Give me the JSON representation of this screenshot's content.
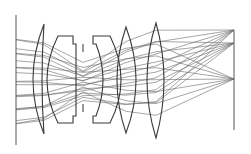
{
  "diagram": {
    "type": "optical-lens-ray-trace",
    "background": "#ffffff",
    "colors": {
      "lens": "#3a3a3a",
      "ray": "#6a6a6a",
      "plane": "#555555"
    },
    "object_plane": {
      "x": 16,
      "y1": 15,
      "y2": 145
    },
    "image_plane": {
      "x": 234,
      "y1": 30,
      "y2": 130
    },
    "aperture_stop": {
      "x": 83,
      "top": [
        44,
        52
      ],
      "bottom": [
        104,
        112
      ]
    },
    "focal_points": [
      {
        "x": 234,
        "y": 30
      },
      {
        "x": 234,
        "y": 43
      },
      {
        "x": 234,
        "y": 79
      }
    ],
    "lens_elements": [
      {
        "id": "element-1",
        "path": "M44,24 Q22,80 44,134 Q40,80 44,24 Z"
      },
      {
        "id": "element-2",
        "path": "M58,36 L73,36 L73,44 L76,44 L76,116 L73,116 L73,123 L58,123 Q36,80 58,36 Z"
      },
      {
        "id": "element-3",
        "path": "M93,36 L110,36 Q132,80 110,123 L93,123 L93,116 L96,116 Q110,80 96,44 L93,44 Z"
      },
      {
        "id": "element-4",
        "path": "M126,27 Q146,80 126,133 Q108,80 126,27 Z"
      },
      {
        "id": "element-5",
        "path": "M156,23 Q172,80 156,138 Q138,80 156,23 Z"
      }
    ],
    "ray_bundles": [
      {
        "focus_y": 30,
        "start_ys": [
          42,
          56,
          70,
          84,
          98,
          112,
          126
        ]
      },
      {
        "focus_y": 43,
        "start_ys": [
          50,
          62,
          74,
          86,
          98,
          110,
          122
        ]
      },
      {
        "focus_y": 79,
        "start_ys": [
          38,
          52,
          66,
          80,
          94,
          108,
          122
        ]
      }
    ]
  }
}
